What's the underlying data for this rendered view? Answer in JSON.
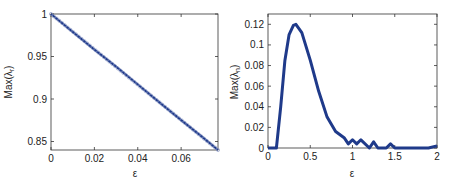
{
  "chart_data": [
    {
      "type": "line",
      "title": "",
      "xlabel": "ε",
      "ylabel": "Max(λr)",
      "xlim": [
        0,
        0.077
      ],
      "ylim": [
        0.84,
        1.0
      ],
      "xticks": [
        "0",
        "0.02",
        "0.04",
        "0.06"
      ],
      "yticks": [
        "0.85",
        "0.9",
        "0.95",
        "1"
      ],
      "grid": false,
      "series": [
        {
          "name": "Max(λr)",
          "color": "#1f3a8a",
          "marker": "o",
          "x": [
            0,
            0.01,
            0.02,
            0.03,
            0.04,
            0.05,
            0.06,
            0.07,
            0.077
          ],
          "y": [
            1.0,
            0.979,
            0.958,
            0.938,
            0.917,
            0.896,
            0.875,
            0.855,
            0.84
          ]
        }
      ]
    },
    {
      "type": "line",
      "title": "",
      "xlabel": "ε",
      "ylabel": "Max(λn)",
      "xlim": [
        0,
        2
      ],
      "ylim": [
        0,
        0.13
      ],
      "xticks": [
        "0",
        "0.5",
        "1",
        "1.5",
        "2"
      ],
      "yticks": [
        "0",
        "0.02",
        "0.04",
        "0.06",
        "0.08",
        "0.1",
        "0.12"
      ],
      "grid": false,
      "series": [
        {
          "name": "Max(λn)",
          "color": "#1f3a8a",
          "x": [
            0,
            0.1,
            0.15,
            0.2,
            0.25,
            0.3,
            0.33,
            0.4,
            0.5,
            0.6,
            0.7,
            0.8,
            0.9,
            0.95,
            1.0,
            1.05,
            1.1,
            1.2,
            1.25,
            1.3,
            1.4,
            1.45,
            1.5,
            1.9,
            2.0
          ],
          "y": [
            0,
            0,
            0.04,
            0.085,
            0.11,
            0.119,
            0.12,
            0.112,
            0.085,
            0.055,
            0.03,
            0.016,
            0.01,
            0.004,
            0.008,
            0.004,
            0.008,
            0.0,
            0.006,
            0.0,
            0.0,
            0.004,
            0.0,
            0.0,
            0.002
          ]
        }
      ]
    }
  ]
}
